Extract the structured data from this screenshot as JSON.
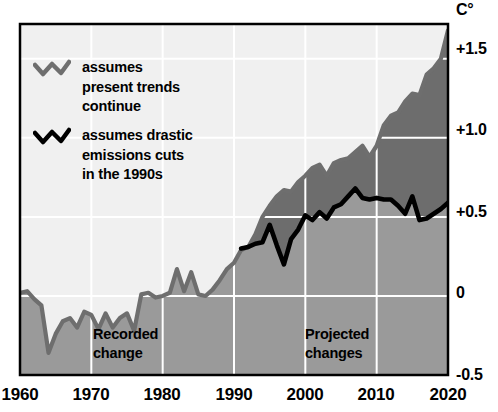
{
  "chart_data": {
    "type": "line",
    "title": "",
    "subtitle": "",
    "xlabel": "",
    "ylabel": "C°",
    "y_unit_label": "C°",
    "xlim": [
      1960,
      2020
    ],
    "ylim": [
      -0.5,
      1.72
    ],
    "grid": true,
    "grid_color": "#ffffff",
    "legend_position": "inside-top-left",
    "x_ticks": [
      1960,
      1970,
      1980,
      1990,
      2000,
      2010,
      2020
    ],
    "x_tick_labels": [
      "1960",
      "1970",
      "1980",
      "1990",
      "2000",
      "2010",
      "2020"
    ],
    "y_ticks": [
      -0.5,
      0,
      0.5,
      1.0,
      1.5
    ],
    "y_tick_labels": [
      "-0.5",
      "0",
      "+0.5",
      "+1.0",
      "+1.5"
    ],
    "annotations": [
      {
        "text": "Recorded\nchange",
        "x": 1970,
        "y": -0.28
      },
      {
        "text": "Projected\nchanges",
        "x": 2000,
        "y": -0.28
      }
    ],
    "series": [
      {
        "name": "assumes present trends continue",
        "label": "assumes\npresent trends\ncontinue",
        "color": "#6e6e6e",
        "x": [
          1960,
          1961,
          1962,
          1963,
          1964,
          1965,
          1966,
          1967,
          1968,
          1969,
          1970,
          1971,
          1972,
          1973,
          1974,
          1975,
          1976,
          1977,
          1978,
          1979,
          1980,
          1981,
          1982,
          1983,
          1984,
          1985,
          1986,
          1987,
          1988,
          1989,
          1990,
          1991,
          1992,
          1993,
          1994,
          1995,
          1996,
          1997,
          1998,
          1999,
          2000,
          2001,
          2002,
          2003,
          2004,
          2005,
          2006,
          2007,
          2008,
          2009,
          2010,
          2011,
          2012,
          2013,
          2014,
          2015,
          2016,
          2017,
          2018,
          2019,
          2020
        ],
        "values": [
          0.02,
          0.03,
          -0.02,
          -0.06,
          -0.36,
          -0.24,
          -0.16,
          -0.14,
          -0.2,
          -0.1,
          -0.12,
          -0.21,
          -0.11,
          -0.2,
          -0.14,
          -0.11,
          -0.22,
          0.01,
          0.02,
          -0.01,
          0.0,
          0.02,
          0.17,
          0.03,
          0.15,
          0.01,
          0.0,
          0.04,
          0.1,
          0.17,
          0.21,
          0.29,
          0.31,
          0.39,
          0.5,
          0.57,
          0.63,
          0.67,
          0.66,
          0.72,
          0.76,
          0.81,
          0.83,
          0.76,
          0.84,
          0.86,
          0.87,
          0.91,
          0.95,
          0.88,
          0.95,
          1.08,
          1.14,
          1.16,
          1.23,
          1.28,
          1.27,
          1.4,
          1.44,
          1.5,
          1.68
        ]
      },
      {
        "name": "assumes drastic emissions cuts in the 1990s",
        "label": "assumes drastic\nemissions cuts\nin the 1990s",
        "color": "#000000",
        "x": [
          1991,
          1992,
          1993,
          1994,
          1995,
          1996,
          1997,
          1998,
          1999,
          2000,
          2001,
          2002,
          2003,
          2004,
          2005,
          2006,
          2007,
          2008,
          2009,
          2010,
          2011,
          2012,
          2013,
          2014,
          2015,
          2016,
          2017,
          2018,
          2019,
          2020
        ],
        "values": [
          0.3,
          0.31,
          0.33,
          0.34,
          0.45,
          0.32,
          0.2,
          0.36,
          0.42,
          0.51,
          0.48,
          0.53,
          0.49,
          0.56,
          0.58,
          0.63,
          0.68,
          0.62,
          0.61,
          0.62,
          0.61,
          0.61,
          0.57,
          0.52,
          0.63,
          0.48,
          0.49,
          0.52,
          0.55,
          0.59
        ]
      }
    ],
    "regions": [
      {
        "name": "recorded",
        "x_start": 1960,
        "x_end": 1990
      },
      {
        "name": "projected",
        "x_start": 1990,
        "x_end": 2020
      }
    ],
    "colors": {
      "background_above_curve": "#f0f0f0",
      "fill_below_curve": "#9a9a9a",
      "fill_between_projections": "#6d6d6d",
      "grid": "#ffffff",
      "frame": "#000000",
      "trends_line": "#6e6e6e",
      "cuts_line": "#000000",
      "text": "#000000"
    }
  },
  "legend": {
    "entries": [
      {
        "label": "assumes\npresent trends\ncontinue",
        "color": "#6e6e6e"
      },
      {
        "label": "assumes drastic\nemissions cuts\nin the 1990s",
        "color": "#000000"
      }
    ]
  },
  "axes": {
    "y_unit": "C°",
    "y_labels": [
      "+1.5",
      "+1.0",
      "+0.5",
      "0",
      "-0.5"
    ],
    "x_labels": [
      "1960",
      "1970",
      "1980",
      "1990",
      "2000",
      "2010",
      "2020"
    ]
  },
  "notes": {
    "recorded": "Recorded\nchange",
    "projected": "Projected\nchanges"
  }
}
